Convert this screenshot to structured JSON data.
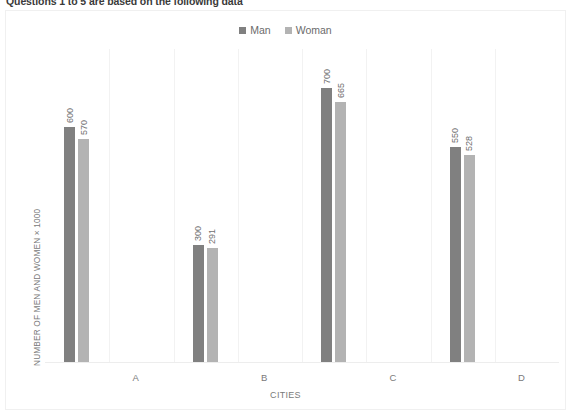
{
  "document": {
    "heading": "Questions 1 to 5 are based on the following data"
  },
  "chart_data": {
    "type": "bar",
    "title": "",
    "categories": [
      "A",
      "B",
      "C",
      "D"
    ],
    "series": [
      {
        "name": "Man",
        "color": "#808080",
        "values": [
          600,
          300,
          700,
          550
        ]
      },
      {
        "name": "Woman",
        "color": "#b3b3b3",
        "values": [
          570,
          291,
          665,
          528
        ]
      }
    ],
    "xlabel": "CITIES",
    "ylabel": "NUMBER OF MEN AND WOMEN × 1000",
    "ylim": [
      0,
      800
    ],
    "grid": "vertical",
    "legend_position": "top-center",
    "data_labels": {
      "A": {
        "Man": "600",
        "Woman": "570"
      },
      "B": {
        "Man": "300",
        "Woman": "291"
      },
      "C": {
        "Man": "700",
        "Woman": "665"
      },
      "D": {
        "Man": "550",
        "Woman": "528"
      }
    }
  }
}
